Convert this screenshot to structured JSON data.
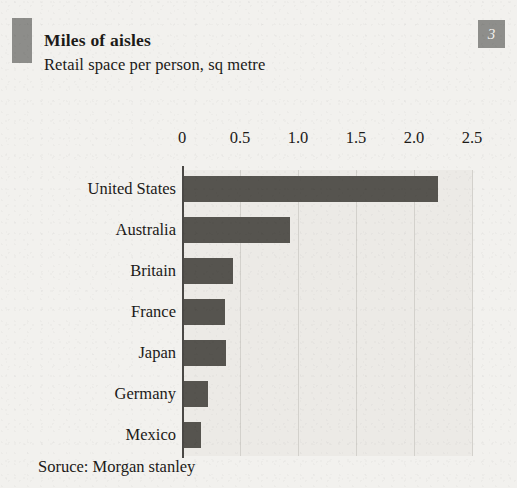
{
  "header": {
    "title": "Miles of aisles",
    "subtitle": "Retail space per person, sq metre",
    "badge": "3"
  },
  "footer": {
    "source": "Soruce: Morgan stanley"
  },
  "colors": {
    "page_background": "#f2f1ee",
    "plot_background": "#eceae6",
    "bar": "#56544f",
    "accent_block": "#8d8d8a",
    "badge": "#8e8e8b",
    "gridline": "#d3d1cc",
    "axis": "#4a4845",
    "text": "#1c1a18"
  },
  "chart_data": {
    "type": "bar",
    "orientation": "horizontal",
    "title": "Miles of aisles",
    "subtitle": "Retail space per person, sq metre",
    "xlabel": "",
    "ylabel": "",
    "xlim": [
      0,
      2.5
    ],
    "xticks": [
      0,
      0.5,
      1.0,
      1.5,
      2.0,
      2.5
    ],
    "xticklabels": [
      "0",
      "0.5",
      "1.0",
      "1.5",
      "2.0",
      "2.5"
    ],
    "grid": true,
    "legend": false,
    "source": "Soruce: Morgan stanley",
    "categories": [
      "United States",
      "Australia",
      "Britain",
      "France",
      "Japan",
      "Germany",
      "Mexico"
    ],
    "values": [
      2.21,
      0.93,
      0.44,
      0.37,
      0.38,
      0.22,
      0.16
    ]
  }
}
